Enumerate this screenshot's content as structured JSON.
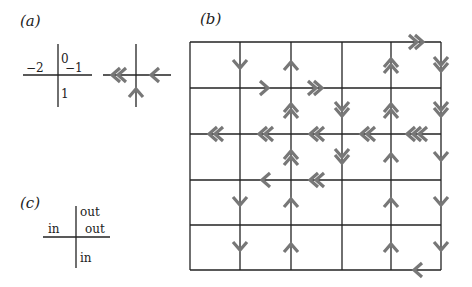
{
  "panels": {
    "a": {
      "label": "(a)",
      "cross1": {
        "cx": 58,
        "cy": 75,
        "x1": 23,
        "x2": 92,
        "y1": 44,
        "y2": 107
      },
      "labels": [
        {
          "text": "0",
          "x": 61,
          "y": 63
        },
        {
          "text": "−2",
          "x": 26,
          "y": 72
        },
        {
          "text": "−1",
          "x": 65,
          "y": 72
        },
        {
          "text": "1",
          "x": 61,
          "y": 98
        }
      ],
      "cross2": {
        "cx": 136,
        "cy": 75,
        "x1": 103,
        "x2": 171,
        "y1": 44,
        "y2": 107
      },
      "arrows": [
        {
          "x": 118,
          "y": 75,
          "dir": "left",
          "count": 2
        },
        {
          "x": 154,
          "y": 75,
          "dir": "left",
          "count": 1
        },
        {
          "x": 136,
          "y": 92,
          "dir": "up",
          "count": 1
        }
      ]
    },
    "b": {
      "label": "(b)",
      "grid": {
        "xs": [
          190,
          240,
          291,
          342,
          391,
          441
        ],
        "ys": [
          42,
          88,
          134,
          180,
          225,
          270
        ]
      },
      "arrows": [
        {
          "x": 240,
          "y": 65,
          "dir": "down",
          "count": 1
        },
        {
          "x": 291,
          "y": 65,
          "dir": "up",
          "count": 1
        },
        {
          "x": 265,
          "y": 88,
          "dir": "right",
          "count": 1
        },
        {
          "x": 316,
          "y": 88,
          "dir": "right",
          "count": 2
        },
        {
          "x": 391,
          "y": 65,
          "dir": "up",
          "count": 2
        },
        {
          "x": 417,
          "y": 42,
          "dir": "right",
          "count": 2
        },
        {
          "x": 441,
          "y": 65,
          "dir": "down",
          "count": 2
        },
        {
          "x": 291,
          "y": 110,
          "dir": "up",
          "count": 2
        },
        {
          "x": 342,
          "y": 110,
          "dir": "down",
          "count": 2
        },
        {
          "x": 391,
          "y": 110,
          "dir": "up",
          "count": 2
        },
        {
          "x": 441,
          "y": 110,
          "dir": "down",
          "count": 2
        },
        {
          "x": 215,
          "y": 134,
          "dir": "left",
          "count": 2
        },
        {
          "x": 265,
          "y": 134,
          "dir": "left",
          "count": 2
        },
        {
          "x": 316,
          "y": 134,
          "dir": "left",
          "count": 2
        },
        {
          "x": 367,
          "y": 134,
          "dir": "left",
          "count": 2
        },
        {
          "x": 416,
          "y": 134,
          "dir": "left",
          "count": 3
        },
        {
          "x": 291,
          "y": 157,
          "dir": "up",
          "count": 2
        },
        {
          "x": 342,
          "y": 157,
          "dir": "down",
          "count": 2
        },
        {
          "x": 391,
          "y": 157,
          "dir": "up",
          "count": 1
        },
        {
          "x": 441,
          "y": 157,
          "dir": "down",
          "count": 1
        },
        {
          "x": 265,
          "y": 180,
          "dir": "left",
          "count": 1
        },
        {
          "x": 316,
          "y": 180,
          "dir": "left",
          "count": 2
        },
        {
          "x": 240,
          "y": 202,
          "dir": "down",
          "count": 1
        },
        {
          "x": 291,
          "y": 202,
          "dir": "up",
          "count": 1
        },
        {
          "x": 391,
          "y": 202,
          "dir": "up",
          "count": 1
        },
        {
          "x": 441,
          "y": 202,
          "dir": "down",
          "count": 1
        },
        {
          "x": 240,
          "y": 247,
          "dir": "down",
          "count": 1
        },
        {
          "x": 291,
          "y": 247,
          "dir": "up",
          "count": 1
        },
        {
          "x": 391,
          "y": 247,
          "dir": "up",
          "count": 1
        },
        {
          "x": 441,
          "y": 247,
          "dir": "down",
          "count": 1
        },
        {
          "x": 417,
          "y": 270,
          "dir": "left",
          "count": 1
        }
      ]
    },
    "c": {
      "label": "(c)",
      "cross": {
        "cx": 76,
        "cy": 237,
        "x1": 43,
        "x2": 110,
        "y1": 206,
        "y2": 268
      },
      "labels": [
        {
          "text": "out",
          "x": 80,
          "y": 216
        },
        {
          "text": "in",
          "x": 48,
          "y": 233
        },
        {
          "text": "out",
          "x": 85,
          "y": 233
        },
        {
          "text": "in",
          "x": 80,
          "y": 262
        }
      ]
    }
  },
  "style": {
    "line_color": "#222222",
    "arrow_color": "#777777"
  }
}
